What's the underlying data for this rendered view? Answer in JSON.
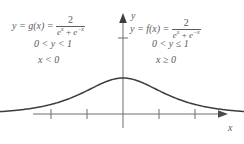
{
  "figure": {
    "background_color": "#ffffff",
    "ink_color": "#5a5a60",
    "curve_color": "#3c3c42"
  },
  "left_branch": {
    "formula_prefix": "y = g(x) =",
    "numerator": "2",
    "denominator_terms": [
      "e",
      "x",
      " + ",
      "e",
      "−x"
    ],
    "denominator_plain": "eˣ + e⁻ˣ",
    "range": "0 < y < 1",
    "domain": "x < 0"
  },
  "right_branch": {
    "formula_prefix": "y = f(x) =",
    "numerator": "2",
    "denominator_plain": "eˣ + e⁻ˣ",
    "range": "0 < y ≤ 1",
    "domain": "x ≥ 0"
  },
  "axes": {
    "y_label": "y",
    "x_label": "x",
    "y_tick_count": 1,
    "x_tick_count": 5
  },
  "chart_data": {
    "type": "line",
    "title": "",
    "xlabel": "x",
    "ylabel": "y",
    "function": "y = 2 / (e^x + e^-x)",
    "xlim": [
      -3.6,
      3.6
    ],
    "ylim": [
      0,
      1.35
    ],
    "grid": false,
    "legend": null,
    "x": [
      -3.6,
      -3.2,
      -2.8,
      -2.4,
      -2.0,
      -1.6,
      -1.2,
      -0.8,
      -0.4,
      0.0,
      0.4,
      0.8,
      1.2,
      1.6,
      2.0,
      2.4,
      2.8,
      3.2,
      3.6
    ],
    "y": [
      0.055,
      0.081,
      0.121,
      0.18,
      0.266,
      0.385,
      0.538,
      0.706,
      0.855,
      1.0,
      0.855,
      0.706,
      0.538,
      0.385,
      0.266,
      0.18,
      0.121,
      0.081,
      0.055
    ],
    "x_ticks": [
      -2,
      -1,
      0,
      1,
      2
    ],
    "y_ticks": [
      1
    ]
  }
}
